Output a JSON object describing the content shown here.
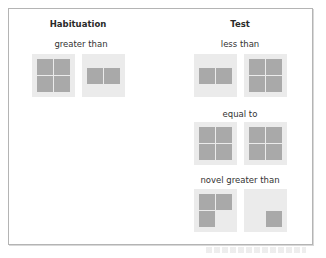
{
  "columns": {
    "habituation": {
      "title": "Habituation",
      "rows": [
        {
          "label": "greater than",
          "cards": [
            {
              "name": "four-squares",
              "squares": [
                "tl",
                "tr",
                "bl",
                "br"
              ]
            },
            {
              "name": "two-squares",
              "squares": [
                "ml",
                "mr"
              ]
            }
          ]
        }
      ]
    },
    "test": {
      "title": "Test",
      "rows": [
        {
          "label": "less than",
          "cards": [
            {
              "name": "two-squares",
              "squares": [
                "ml",
                "mr"
              ]
            },
            {
              "name": "four-squares",
              "squares": [
                "tl",
                "tr",
                "bl",
                "br"
              ]
            }
          ]
        },
        {
          "label": "equal to",
          "cards": [
            {
              "name": "four-squares",
              "squares": [
                "tl",
                "tr",
                "bl",
                "br"
              ]
            },
            {
              "name": "four-squares",
              "squares": [
                "tl",
                "tr",
                "bl",
                "br"
              ]
            }
          ]
        },
        {
          "label": "novel greater than",
          "cards": [
            {
              "name": "three-squares",
              "squares": [
                "tl",
                "tr",
                "bl"
              ]
            },
            {
              "name": "one-square",
              "squares": [
                "br"
              ]
            }
          ]
        }
      ]
    }
  },
  "colors": {
    "card": "#ebebeb",
    "square": "#a9a9a9",
    "frame": "#b4b4b4"
  }
}
